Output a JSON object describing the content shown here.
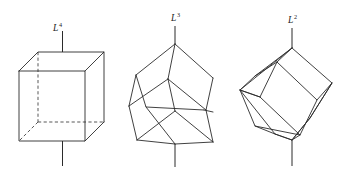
{
  "figure": {
    "title": "",
    "background_color": "#ffffff",
    "line_color": "#2b2b2b",
    "width": 357,
    "height": 174
  },
  "panels": [
    {
      "id": "panel-l4",
      "axis_label_base": "L",
      "axis_label_exponent": "4",
      "axis_label_text": "L4",
      "axis_order": 4,
      "axis_description": "four-fold rotation axis through centres of opposite cube faces",
      "orientation": "upright cube, axonometric view",
      "hidden_edges_visible": true
    },
    {
      "id": "panel-l3",
      "axis_label_base": "L",
      "axis_label_exponent": "3",
      "axis_label_text": "L3",
      "axis_order": 3,
      "axis_description": "three-fold rotation axis through opposite cube vertices (body diagonal)",
      "orientation": "cube tilted to stand on a vertex",
      "hidden_edges_visible": false
    },
    {
      "id": "panel-l2",
      "axis_label_base": "L",
      "axis_label_exponent": "2",
      "axis_label_text": "L2",
      "axis_order": 2,
      "axis_description": "two-fold rotation axis through midpoints of opposite cube edges",
      "orientation": "cube tilted to balance on an edge",
      "hidden_edges_visible": false
    }
  ]
}
